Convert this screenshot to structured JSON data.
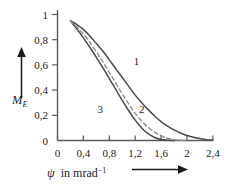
{
  "chart_data": {
    "type": "line",
    "title": "",
    "xlabel": "ψ in mrad⁻¹",
    "ylabel": "M_E",
    "ylabel_base": "M",
    "ylabel_sub": "E",
    "xlabel_symbol": "ψ",
    "xlabel_text": "in mrad",
    "xlabel_exponent": "−1",
    "xlim": [
      0,
      2.4
    ],
    "ylim": [
      0,
      1
    ],
    "grid": false,
    "legend": "inline-curve-labels",
    "xticks": [
      0,
      0.4,
      0.8,
      1.2,
      1.6,
      2,
      2.4
    ],
    "xticklabels": [
      "0",
      "0,4",
      "0,8",
      "1,2",
      "1,6",
      "2",
      "2,4"
    ],
    "yticks": [
      0,
      0.2,
      0.4,
      0.6,
      0.8,
      1
    ],
    "yticklabels": [
      "0",
      "0,2",
      "0,4",
      "0,6",
      "0,8",
      "1"
    ],
    "series": [
      {
        "name": "1",
        "label": "1",
        "style": "solid",
        "color": "#4a4a4a",
        "label_x": 1.22,
        "label_y": 0.6,
        "x": [
          0.2,
          0.3,
          0.4,
          0.5,
          0.6,
          0.7,
          0.8,
          0.9,
          1.0,
          1.1,
          1.2,
          1.3,
          1.4,
          1.5,
          1.6,
          1.7,
          1.8,
          1.9,
          2.0,
          2.1,
          2.2,
          2.3,
          2.4
        ],
        "y": [
          0.95,
          0.92,
          0.88,
          0.83,
          0.77,
          0.71,
          0.64,
          0.57,
          0.5,
          0.43,
          0.36,
          0.3,
          0.245,
          0.195,
          0.15,
          0.115,
          0.085,
          0.06,
          0.04,
          0.026,
          0.015,
          0.007,
          0.002
        ]
      },
      {
        "name": "2",
        "label": "2",
        "style": "dashed",
        "color": "#8c8c8c",
        "label_x": 1.3,
        "label_y": 0.215,
        "x": [
          0.2,
          0.3,
          0.4,
          0.5,
          0.6,
          0.7,
          0.8,
          0.9,
          1.0,
          1.1,
          1.2,
          1.3,
          1.4,
          1.5,
          1.6,
          1.7,
          1.8,
          1.9,
          2.0
        ],
        "y": [
          0.95,
          0.9,
          0.845,
          0.78,
          0.705,
          0.625,
          0.54,
          0.455,
          0.37,
          0.29,
          0.215,
          0.155,
          0.105,
          0.066,
          0.038,
          0.018,
          0.007,
          0.002,
          0.0
        ]
      },
      {
        "name": "3",
        "label": "3",
        "style": "solid",
        "color": "#4a4a4a",
        "label_x": 0.66,
        "label_y": 0.215,
        "x": [
          0.2,
          0.3,
          0.4,
          0.5,
          0.6,
          0.7,
          0.8,
          0.9,
          1.0,
          1.1,
          1.2,
          1.3,
          1.4,
          1.5,
          1.6,
          1.7,
          1.8
        ],
        "y": [
          0.95,
          0.885,
          0.815,
          0.74,
          0.66,
          0.578,
          0.492,
          0.405,
          0.318,
          0.236,
          0.162,
          0.1,
          0.054,
          0.024,
          0.008,
          0.002,
          0.0
        ]
      }
    ],
    "annotations": [
      {
        "name": "y-axis-direction-arrow",
        "direction": "up"
      },
      {
        "name": "x-axis-direction-arrow",
        "direction": "right"
      }
    ]
  }
}
